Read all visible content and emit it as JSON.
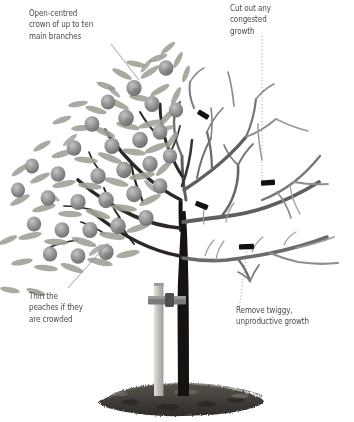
{
  "figure": {
    "background_color": "#ffffff",
    "width": 354,
    "height": 422
  },
  "callouts": [
    {
      "id": "crown",
      "text": "Open-centred\ncrown of up to ten\nmain branches",
      "target": "canopy-top-left",
      "leader_style": "solid"
    },
    {
      "id": "congested",
      "text": "Cut out any\ncongested\ngrowth",
      "target": "cut-mark-center-right",
      "leader_style": "dotted"
    },
    {
      "id": "thin",
      "text": "Thin the\npeaches if they\nare crowded",
      "target": "fruit-cluster-left",
      "leader_style": "solid"
    },
    {
      "id": "remove",
      "text": "Remove twiggy,\nunproductive growth",
      "target": "cut-mark-lower-right",
      "leader_style": "dotted"
    }
  ],
  "illustration": {
    "colors": {
      "trunk": "#15120f",
      "bare_branch": "#5d5d5d",
      "bare_branch_light": "#9a9a9a",
      "leaf": "#9ba095",
      "leaf_dark": "#7e837a",
      "fruit": "#8c8c8c",
      "fruit_shadow": "#6f6f6f",
      "stake": "#bdbdb6",
      "tie": "#7e7e7e",
      "soil": "#4a4540",
      "text": "#4b4b4b",
      "leader": "#8a8a8a"
    },
    "parts": [
      {
        "name": "trunk",
        "description": "dark vertical trunk rising from soil mound"
      },
      {
        "name": "stake",
        "description": "light grey supporting stake left of trunk"
      },
      {
        "name": "tie",
        "description": "grey tie band joining stake to trunk"
      },
      {
        "name": "soil-mound",
        "description": "dark textured mulch mound at base"
      },
      {
        "name": "leafy-canopy-left",
        "description": "left half bearing leaves and peaches"
      },
      {
        "name": "bare-canopy-right",
        "description": "right half of bare branches"
      }
    ],
    "cut_marks": [
      {
        "id": 1,
        "x": 203,
        "y": 117
      },
      {
        "id": 2,
        "x": 268,
        "y": 183
      },
      {
        "id": 3,
        "x": 202,
        "y": 206
      },
      {
        "id": 4,
        "x": 246,
        "y": 247
      }
    ],
    "fruit_count": 31
  }
}
